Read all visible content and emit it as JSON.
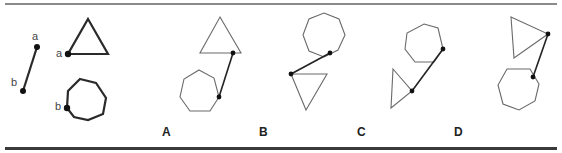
{
  "colors": {
    "bold_stroke": "#2a2a2a",
    "thin_stroke": "#6a6a6a",
    "connector": "#222222",
    "dot": "#111111",
    "rule_top": "#8a8a8a",
    "rule_bottom": "#3a3a3a"
  },
  "legend": {
    "segment": {
      "a": [
        37,
        47
      ],
      "b": [
        23,
        91
      ],
      "label_a": "a",
      "label_b": "b"
    },
    "triangle": {
      "points": [
        [
          88,
          19
        ],
        [
          108,
          54
        ],
        [
          68,
          54
        ]
      ],
      "dot": [
        68,
        54
      ],
      "label": "a"
    },
    "heptagon": {
      "points": [
        [
          80,
          79
        ],
        [
          96,
          83
        ],
        [
          106,
          98
        ],
        [
          103,
          114
        ],
        [
          88,
          120
        ],
        [
          74,
          117
        ],
        [
          67,
          108
        ],
        [
          68,
          91
        ]
      ],
      "dot": [
        67,
        108
      ],
      "label": "b"
    }
  },
  "options": [
    {
      "label": "A",
      "label_pos": [
        166,
        131
      ],
      "triangle": [
        [
          220,
          17
        ],
        [
          241,
          53
        ],
        [
          200,
          53
        ]
      ],
      "heptagon": [
        [
          199,
          70
        ],
        [
          214,
          78
        ],
        [
          219,
          97
        ],
        [
          210,
          111
        ],
        [
          190,
          111
        ],
        [
          180,
          97
        ],
        [
          184,
          79
        ]
      ],
      "connector": [
        [
          233,
          53
        ],
        [
          219,
          97
        ]
      ]
    },
    {
      "label": "B",
      "label_pos": [
        263,
        131
      ],
      "triangle": [
        [
          291,
          74
        ],
        [
          327,
          74
        ],
        [
          306,
          110
        ]
      ],
      "heptagon": [
        [
          324,
          13
        ],
        [
          339,
          19
        ],
        [
          345,
          35
        ],
        [
          338,
          50
        ],
        [
          324,
          57
        ],
        [
          309,
          51
        ],
        [
          303,
          35
        ],
        [
          309,
          19
        ]
      ],
      "connector": [
        [
          330,
          53
        ],
        [
          291,
          74
        ]
      ]
    },
    {
      "label": "C",
      "label_pos": [
        361,
        131
      ],
      "triangle": [
        [
          393,
          69
        ],
        [
          412,
          91
        ],
        [
          391,
          108
        ]
      ],
      "heptagon": [
        [
          424,
          24
        ],
        [
          438,
          28
        ],
        [
          443,
          49
        ],
        [
          434,
          62
        ],
        [
          415,
          62
        ],
        [
          405,
          49
        ],
        [
          407,
          33
        ]
      ],
      "connector": [
        [
          443,
          49
        ],
        [
          412,
          91
        ]
      ]
    },
    {
      "label": "D",
      "label_pos": [
        458,
        131
      ],
      "triangle": [
        [
          511,
          17
        ],
        [
          548,
          34
        ],
        [
          514,
          58
        ]
      ],
      "heptagon": [
        [
          507,
          69
        ],
        [
          530,
          69
        ],
        [
          539,
          84
        ],
        [
          535,
          101
        ],
        [
          519,
          110
        ],
        [
          503,
          104
        ],
        [
          498,
          85
        ]
      ],
      "connector": [
        [
          548,
          34
        ],
        [
          533,
          77
        ]
      ]
    }
  ]
}
